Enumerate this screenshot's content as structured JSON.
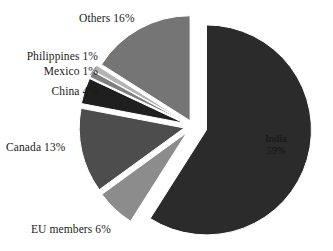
{
  "chart_data": {
    "type": "pie",
    "title": "",
    "subtitle": "",
    "categories": [
      "India",
      "EU members",
      "Canada",
      "China",
      "Mexico",
      "Philippines",
      "Others"
    ],
    "values": [
      59,
      6,
      13,
      4,
      1,
      1,
      16
    ],
    "unit": "%",
    "legend": "none",
    "exploded": true,
    "labels": {
      "india": "India",
      "india_value": "59%",
      "eu": "EU members 6%",
      "canada": "Canada 13%",
      "china": "China 4%",
      "mexico": "Mexico 1%",
      "philippines": "Philippines 1%",
      "others": "Others 16%"
    },
    "slices": [
      {
        "name": "India",
        "label": "India 59%",
        "value": 59,
        "color": "#2b2b2b",
        "start_deg": 0,
        "end_deg": 212.4,
        "explode": 14,
        "label_inside": true
      },
      {
        "name": "EU members",
        "label": "EU members 6%",
        "value": 6,
        "color": "#8c8c8c",
        "start_deg": 212.4,
        "end_deg": 234.0,
        "explode": 9,
        "label_inside": false
      },
      {
        "name": "Canada",
        "label": "Canada 13%",
        "value": 13,
        "color": "#4d4d4d",
        "start_deg": 234.0,
        "end_deg": 280.8,
        "explode": 9,
        "label_inside": false
      },
      {
        "name": "China",
        "label": "China 4%",
        "value": 4,
        "color": "#1f1f1f",
        "start_deg": 280.8,
        "end_deg": 295.2,
        "explode": 9,
        "label_inside": false
      },
      {
        "name": "Mexico",
        "label": "Mexico 1%",
        "value": 1,
        "color": "#808080",
        "start_deg": 295.2,
        "end_deg": 298.8,
        "explode": 9,
        "label_inside": false
      },
      {
        "name": "Philippines",
        "label": "Philippines 1%",
        "value": 1,
        "color": "#b3b3b3",
        "start_deg": 298.8,
        "end_deg": 302.4,
        "explode": 9,
        "label_inside": false
      },
      {
        "name": "Others",
        "label": "Others 16%",
        "value": 16,
        "color": "#757575",
        "start_deg": 302.4,
        "end_deg": 360.0,
        "explode": 6,
        "label_inside": false
      }
    ],
    "geometry": {
      "cx": 193,
      "cy": 126,
      "radius": 105
    },
    "background": "#ffffff",
    "text_color": "#1a1a1a"
  }
}
